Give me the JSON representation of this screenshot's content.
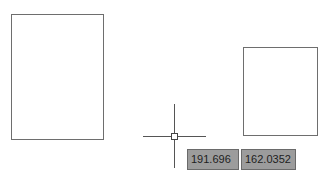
{
  "canvas": {
    "background_color": "#ffffff",
    "shapes": [
      {
        "type": "rectangle",
        "name": "left-rectangle",
        "stroke": "#6e6e6e"
      },
      {
        "type": "rectangle",
        "name": "right-rectangle",
        "stroke": "#6e6e6e"
      }
    ]
  },
  "cursor": {
    "type": "crosshair-with-pickbox",
    "color": "#555555"
  },
  "dynamic_input": {
    "x_value": "191.696",
    "y_value": "162.0352",
    "background_color": "#9c9c9c"
  }
}
